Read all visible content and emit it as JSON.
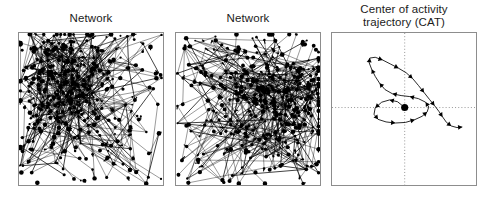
{
  "figure": {
    "background_color": "#ffffff",
    "ink_color": "#000000",
    "frame_color": "#8d8d8d",
    "axis_color": "#8a8a8a"
  },
  "panels": [
    {
      "id": "network-1",
      "title": "Network",
      "type": "network-graph",
      "description": "Dense directed network with heavy node cluster in upper-left quadrant",
      "node_count": 420,
      "edge_count": 520,
      "cluster_center_x": 0.33,
      "cluster_center_y": 0.34,
      "cluster_spread": 0.19,
      "seed": 17
    },
    {
      "id": "network-2",
      "title": "Network",
      "type": "network-graph",
      "description": "Dense directed network with heavy node cluster along the right side",
      "node_count": 420,
      "edge_count": 520,
      "cluster_center_x": 0.7,
      "cluster_center_y": 0.45,
      "cluster_spread": 0.2,
      "seed": 53
    },
    {
      "id": "cat",
      "title": "Center of activity\ntrajectory (CAT)",
      "type": "trajectory",
      "axes": {
        "show_crosshair": true,
        "style": "dotted",
        "origin_x": 0.505,
        "origin_y": 0.49
      }
    }
  ],
  "chart_data": {
    "type": "line",
    "title": "Center of activity trajectory (CAT)",
    "xlabel": "",
    "ylabel": "",
    "xlim": [
      0,
      1
    ],
    "ylim": [
      0,
      1
    ],
    "grid": false,
    "legend": false,
    "annotations": [
      {
        "name": "origin-marker",
        "x": 0.505,
        "y": 0.49,
        "shape": "filled-circle"
      }
    ],
    "series": [
      {
        "name": "CAT path",
        "marker": "arrowhead",
        "points": [
          [
            0.505,
            0.49
          ],
          [
            0.455,
            0.452
          ],
          [
            0.4,
            0.44
          ],
          [
            0.345,
            0.455
          ],
          [
            0.3,
            0.492
          ],
          [
            0.292,
            0.535
          ],
          [
            0.32,
            0.568
          ],
          [
            0.375,
            0.585
          ],
          [
            0.44,
            0.592
          ],
          [
            0.51,
            0.588
          ],
          [
            0.575,
            0.57
          ],
          [
            0.625,
            0.548
          ],
          [
            0.66,
            0.52
          ],
          [
            0.672,
            0.487
          ],
          [
            0.65,
            0.455
          ],
          [
            0.6,
            0.432
          ],
          [
            0.54,
            0.418
          ],
          [
            0.48,
            0.412
          ],
          [
            0.42,
            0.4
          ],
          [
            0.368,
            0.372
          ],
          [
            0.33,
            0.33
          ],
          [
            0.3,
            0.285
          ],
          [
            0.275,
            0.238
          ],
          [
            0.258,
            0.196
          ],
          [
            0.262,
            0.165
          ],
          [
            0.3,
            0.16
          ],
          [
            0.352,
            0.178
          ],
          [
            0.408,
            0.205
          ],
          [
            0.462,
            0.232
          ],
          [
            0.515,
            0.262
          ],
          [
            0.56,
            0.3
          ],
          [
            0.6,
            0.345
          ],
          [
            0.64,
            0.392
          ],
          [
            0.678,
            0.438
          ],
          [
            0.712,
            0.478
          ],
          [
            0.742,
            0.515
          ],
          [
            0.768,
            0.552
          ],
          [
            0.795,
            0.588
          ],
          [
            0.828,
            0.612
          ],
          [
            0.868,
            0.622
          ],
          [
            0.905,
            0.618
          ]
        ]
      }
    ]
  }
}
